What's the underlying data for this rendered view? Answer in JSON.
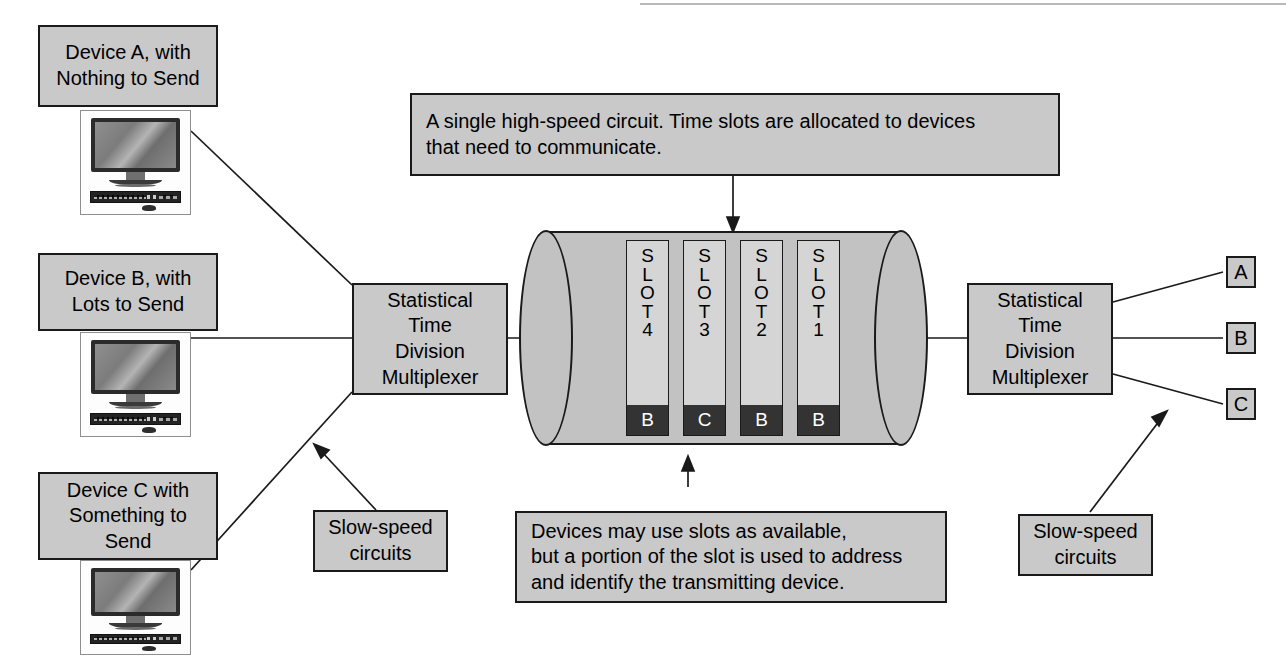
{
  "diagram": {
    "colors": {
      "box_fill": "#c9c9c9",
      "box_border": "#1a1a1a",
      "cylinder_fill": "#c2c2c2",
      "slot_fill": "#d5d5d5",
      "slot_tag_fill": "#333333",
      "slot_tag_text": "#ffffff",
      "page_background": "#ffffff"
    },
    "devices": [
      {
        "label": "Device A, with\nNothing to Send",
        "line1": "Device A, with",
        "line2": "Nothing to Send",
        "icon": "desktop-computer-icon"
      },
      {
        "label": "Device B, with\nLots to Send",
        "line1": "Device B, with",
        "line2": "Lots to Send",
        "icon": "desktop-computer-icon"
      },
      {
        "label": "Device C with\nSomething to\nSend",
        "line1": "Device C with",
        "line2": "Something to",
        "line3": "Send",
        "icon": "desktop-computer-icon"
      }
    ],
    "multiplexer_left": {
      "line1": "Statistical",
      "line2": "Time",
      "line3": "Division",
      "line4": "Multiplexer"
    },
    "multiplexer_right": {
      "line1": "Statistical",
      "line2": "Time",
      "line3": "Division",
      "line4": "Multiplexer"
    },
    "top_callout": {
      "line1": "A single high-speed circuit. Time slots are allocated to devices",
      "line2": "that need to communicate."
    },
    "bottom_callout": {
      "line1": "Devices may use slots as available,",
      "line2": "but a portion of the slot is used to address",
      "line3": "and identify the transmitting device."
    },
    "slow_speed_left": {
      "line1": "Slow-speed",
      "line2": "circuits"
    },
    "slow_speed_right": {
      "line1": "Slow-speed",
      "line2": "circuits"
    },
    "slots": [
      {
        "name": "SLOT4",
        "letters": [
          "S",
          "L",
          "O",
          "T",
          "4"
        ],
        "tag": "B"
      },
      {
        "name": "SLOT3",
        "letters": [
          "S",
          "L",
          "O",
          "T",
          "3"
        ],
        "tag": "C"
      },
      {
        "name": "SLOT2",
        "letters": [
          "S",
          "L",
          "O",
          "T",
          "2"
        ],
        "tag": "B"
      },
      {
        "name": "SLOT1",
        "letters": [
          "S",
          "L",
          "O",
          "T",
          "1"
        ],
        "tag": "B"
      }
    ],
    "outputs": [
      {
        "label": "A"
      },
      {
        "label": "B"
      },
      {
        "label": "C"
      }
    ]
  }
}
